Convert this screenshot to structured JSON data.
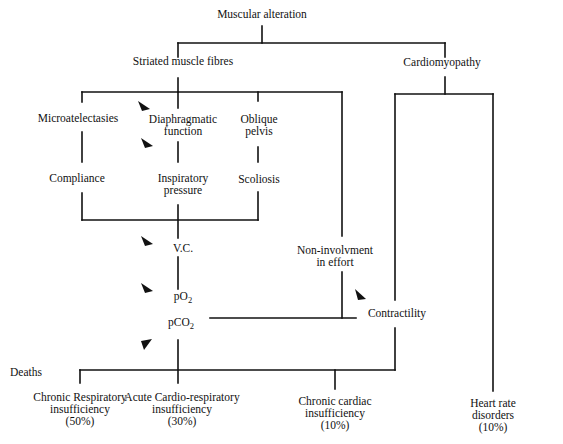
{
  "diagram": {
    "type": "flowchart",
    "root": "Muscular alteration",
    "level1": {
      "left": "Striated muscle fibres",
      "right": "Cardiomyopathy"
    },
    "striated_branch": {
      "row1": [
        "Microatelectasies",
        "Diaphragmatic function",
        "Oblique pelvis"
      ],
      "row1_lines": {
        "microatelectasies": [
          "Microatelectasies"
        ],
        "diaphragmatic": [
          "Diaphragmatic",
          "function"
        ],
        "oblique": [
          "Oblique",
          "pelvis"
        ]
      },
      "row2": {
        "compliance": "Compliance",
        "inspiratory": [
          "Inspiratory",
          "pressure"
        ],
        "scoliosis": "Scoliosis"
      },
      "vc": "V.C.",
      "po2": {
        "base": "pO",
        "sub": "2"
      },
      "pco2": {
        "base": "pCO",
        "sub": "2"
      },
      "non_involvement": [
        "Non-involvment",
        "in effort"
      ]
    },
    "cardio_branch": {
      "contractility": "Contractility"
    },
    "deaths": {
      "label": "Deaths",
      "outcomes": [
        {
          "lines": [
            "Chronic Respiratory",
            "insufficiency",
            "(50%)"
          ],
          "name": "Chronic Respiratory insufficiency",
          "percent": "50%"
        },
        {
          "lines": [
            "Acute Cardio-respiratory",
            "insufficiency",
            "(30%)"
          ],
          "name": "Acute Cardio-respiratory insufficiency",
          "percent": "30%"
        },
        {
          "lines": [
            "Chronic cardiac",
            "insufficiency",
            "(10%)"
          ],
          "name": "Chronic cardiac insufficiency",
          "percent": "10%"
        },
        {
          "lines": [
            "Heart rate",
            "disorders",
            "(10%)"
          ],
          "name": "Heart rate disorders",
          "percent": "10%"
        }
      ]
    },
    "colors": {
      "line": "#111111",
      "background": "#ffffff",
      "text": "#111111"
    }
  }
}
